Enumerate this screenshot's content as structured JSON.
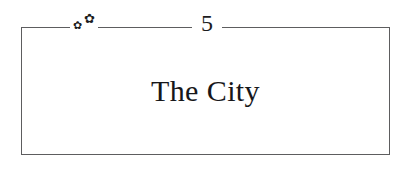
{
  "chapter": {
    "number": "5",
    "title": "The City",
    "ornaments": [
      {
        "name": "floral-ornament-left",
        "glyph": "✿"
      },
      {
        "name": "floral-ornament-right",
        "glyph": "✿"
      }
    ]
  },
  "style": {
    "rule_color": "#5d5d5f",
    "text_color": "#17171a",
    "page_background": "#ffffff"
  }
}
